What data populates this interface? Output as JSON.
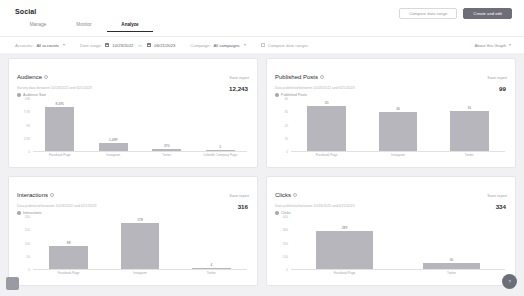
{
  "header": {
    "title": "Social",
    "tabs": [
      {
        "label": "Manage",
        "active": false
      },
      {
        "label": "Monitor",
        "active": false
      },
      {
        "label": "Analyze",
        "active": true
      }
    ],
    "actions": {
      "secondary_label": "Compare date range",
      "primary_label": "Create and edit"
    }
  },
  "filters": {
    "accounts_label": "Accounts:",
    "accounts_value": "All accounts",
    "date_range_label": "Date range:",
    "date_from": "10/23/2022",
    "date_to": "06/21/2023",
    "date_separator": "to",
    "campaign_label": "Campaign:",
    "campaign_value": "All campaigns",
    "compare_label": "Compare date ranges",
    "about_link": "About this Graph"
  },
  "panels": [
    {
      "title": "Audience",
      "export_label": "Save report",
      "subtitle": "Survey data between 10/23/2022 and 6/21/2023",
      "legend": "Audience Size",
      "total": "12,243"
    },
    {
      "title": "Published Posts",
      "export_label": "Save report",
      "subtitle": "Data published between 10/23/2022 and 6/21/2023",
      "legend": "Published Posts",
      "total": "99"
    },
    {
      "title": "Interactions",
      "export_label": "Save report",
      "subtitle": "Data published between 10/23/2022 and 6/21/2023",
      "legend": "Interactions",
      "total": "316"
    },
    {
      "title": "Clicks",
      "export_label": "Save report",
      "subtitle": "Data published between 10/23/2022 and 6/21/2023",
      "legend": "Clicks",
      "total": "334"
    }
  ],
  "corner": {
    "help_label": "?"
  },
  "colors": {
    "bar": "#b6b6bc",
    "accent": "#6e6e78",
    "panel_bg": "#ffffff",
    "page_bg": "#f1f1f3"
  },
  "chart_data": [
    {
      "type": "bar",
      "title": "Audience",
      "xlabel": "",
      "ylabel": "",
      "categories": [
        "Facebook Page",
        "Instagram",
        "Twitter",
        "LinkedIn Company Page"
      ],
      "values": [
        8495,
        1489,
        370,
        1
      ],
      "value_labels": [
        "8,495",
        "1,489",
        "370",
        "1"
      ],
      "yticks": [
        0,
        2500,
        5000,
        7500,
        10000
      ],
      "ytick_labels": [
        "0",
        "2.5K",
        "5K",
        "7.5K",
        "10K"
      ],
      "ylim": [
        0,
        10000
      ],
      "grid": false,
      "legend": "Audience Size",
      "legend_position": "top-left"
    },
    {
      "type": "bar",
      "title": "Published Posts",
      "xlabel": "",
      "ylabel": "",
      "categories": [
        "Facebook Page",
        "Instagram",
        "Twitter"
      ],
      "values": [
        35,
        30,
        31
      ],
      "value_labels": [
        "35",
        "30",
        "31"
      ],
      "yticks": [
        0,
        10,
        20,
        30,
        40
      ],
      "ytick_labels": [
        "0",
        "10",
        "20",
        "30",
        "40"
      ],
      "ylim": [
        0,
        40
      ],
      "grid": false,
      "legend": "Published Posts",
      "legend_position": "top-left"
    },
    {
      "type": "bar",
      "title": "Interactions",
      "xlabel": "",
      "ylabel": "",
      "categories": [
        "Facebook Page",
        "Instagram",
        "Twitter"
      ],
      "values": [
        88,
        178,
        4
      ],
      "value_labels": [
        "88",
        "178",
        "4"
      ],
      "yticks": [
        0,
        50,
        100,
        150,
        200
      ],
      "ytick_labels": [
        "0",
        "50",
        "100",
        "150",
        "200"
      ],
      "ylim": [
        0,
        200
      ],
      "grid": false,
      "legend": "Interactions",
      "legend_position": "top-left"
    },
    {
      "type": "bar",
      "title": "Clicks",
      "xlabel": "",
      "ylabel": "",
      "categories": [
        "Facebook Page",
        "Twitter"
      ],
      "values": [
        289,
        45
      ],
      "value_labels": [
        "289",
        "45"
      ],
      "yticks": [
        0,
        100,
        200,
        300,
        400
      ],
      "ytick_labels": [
        "0",
        "100",
        "200",
        "300",
        "400"
      ],
      "ylim": [
        0,
        400
      ],
      "grid": false,
      "legend": "Clicks",
      "legend_position": "top-left"
    }
  ]
}
